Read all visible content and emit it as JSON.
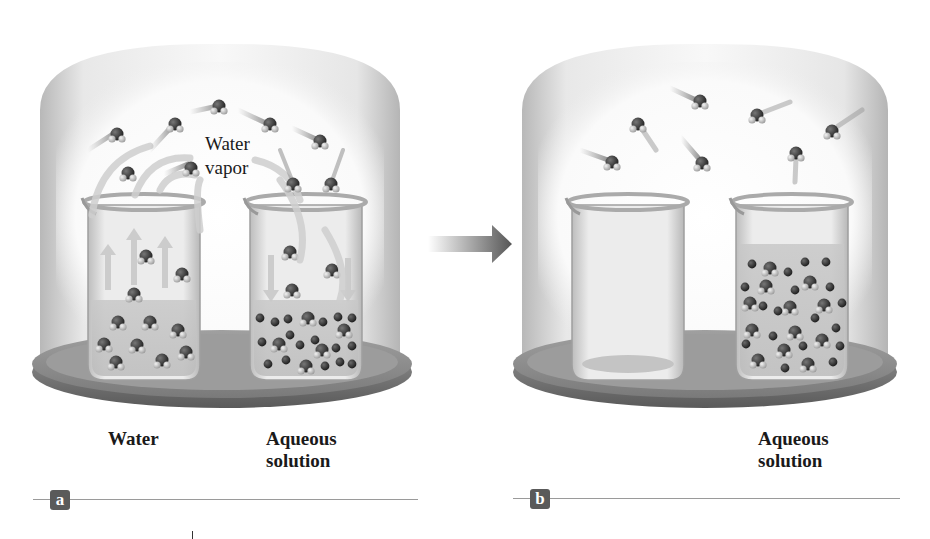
{
  "figure": {
    "panel_a": {
      "badge": "a",
      "vapor_label_line1": "Water",
      "vapor_label_line2": "vapor",
      "left_beaker_label": "Water",
      "right_beaker_label_line1": "Aqueous",
      "right_beaker_label_line2": "solution"
    },
    "panel_b": {
      "badge": "b",
      "right_beaker_label_line1": "Aqueous",
      "right_beaker_label_line2": "solution"
    },
    "arrow": "transition-arrow"
  },
  "colors": {
    "dome": "#d9d9d9",
    "plate": "#8a8a8a",
    "molecule": "#333333",
    "hydrogen": "#d0d0d0",
    "badge": "#5a5a5a",
    "rule": "#9a9a9a"
  }
}
